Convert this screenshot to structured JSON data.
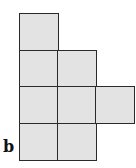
{
  "figure": {
    "label": "b",
    "fill_color": "#e3e3e3",
    "stroke_color": "#2a2a2a",
    "cells": [
      {
        "row": 0,
        "col": 0
      },
      {
        "row": 1,
        "col": 0
      },
      {
        "row": 1,
        "col": 1
      },
      {
        "row": 2,
        "col": 0
      },
      {
        "row": 2,
        "col": 1
      },
      {
        "row": 2,
        "col": 2
      },
      {
        "row": 3,
        "col": 0
      },
      {
        "row": 3,
        "col": 1
      }
    ]
  }
}
